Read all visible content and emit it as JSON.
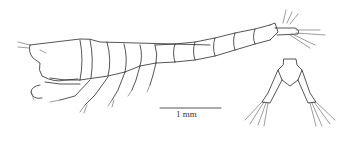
{
  "figure": {
    "scale_bar": {
      "label": "1 mm"
    },
    "colors": {
      "line": "#2a2a2a",
      "background": "#ffffff"
    }
  }
}
